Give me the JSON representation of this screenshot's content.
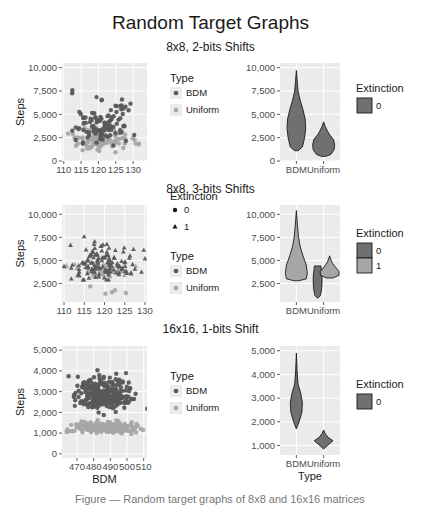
{
  "title": "Random Target Graphs",
  "caption": "Figure — Random target graphs of 8x8 and 16x16 matrices",
  "colors": {
    "panel_bg": "#ebebeb",
    "grid": "#ffffff",
    "bdm": "#595959",
    "uniform": "#a6a6a6",
    "violin_fill": "#707070",
    "violin_fill_light": "#a6a6a6",
    "outline": "#1a1a1a"
  },
  "chart_data": [
    {
      "id": "row1",
      "row_title": "8x8, 2-bits Shifts",
      "scatter": {
        "type": "scatter",
        "xlabel": "",
        "ylabel": "Steps",
        "xlim": [
          109.5,
          134
        ],
        "ylim": [
          0,
          10500
        ],
        "xticks": [
          110,
          115,
          120,
          125,
          130
        ],
        "yticks": [
          0,
          2500,
          5000,
          7500,
          10000
        ],
        "ytick_labels": [
          "0",
          "2,500",
          "5,000",
          "7,500",
          "10,000"
        ],
        "series": [
          {
            "name": "BDM",
            "shape": "circle",
            "n": 110,
            "x_mean": 121,
            "x_sd": 4.5,
            "y_mean": 3600,
            "y_sd": 1400,
            "y_min": 1500,
            "y_max": 9800
          },
          {
            "name": "Uniform",
            "shape": "circle",
            "n": 110,
            "x_mean": 121,
            "x_sd": 4.5,
            "y_mean": 2000,
            "y_sd": 700,
            "y_min": 400,
            "y_max": 4200
          }
        ],
        "legend": {
          "title": "Type",
          "items": [
            "BDM",
            "Uniform"
          ]
        }
      },
      "violin": {
        "type": "violin",
        "xlabel": "",
        "categories": [
          "BDM",
          "Uniform"
        ],
        "ylim": [
          0,
          10500
        ],
        "yticks": [
          0,
          2500,
          5000,
          7500,
          10000
        ],
        "ytick_labels": [
          "0",
          "2,500",
          "5,000",
          "7,500",
          "10,000"
        ],
        "violins": [
          {
            "cat": "BDM",
            "fill": "violin_fill",
            "offset": 0,
            "profile": [
              [
                1100,
                0.15
              ],
              [
                1500,
                0.55
              ],
              [
                2500,
                0.75
              ],
              [
                3500,
                0.85
              ],
              [
                4500,
                0.8
              ],
              [
                5500,
                0.6
              ],
              [
                6500,
                0.35
              ],
              [
                7500,
                0.15
              ],
              [
                8500,
                0.08
              ],
              [
                9700,
                0.0
              ]
            ]
          },
          {
            "cat": "Uniform",
            "fill": "violin_fill",
            "offset": 0,
            "profile": [
              [
                500,
                0.2
              ],
              [
                700,
                0.65
              ],
              [
                1200,
                0.95
              ],
              [
                1700,
                1.0
              ],
              [
                2300,
                0.9
              ],
              [
                2800,
                0.55
              ],
              [
                3200,
                0.35
              ],
              [
                3700,
                0.15
              ],
              [
                4200,
                0.0
              ]
            ]
          }
        ],
        "legend": {
          "title": "Extinction",
          "items": [
            "0"
          ]
        }
      }
    },
    {
      "id": "row2",
      "row_title": "8x8, 3-bits Shifts",
      "scatter": {
        "type": "scatter",
        "xlabel": "",
        "ylabel": "Steps",
        "xlim": [
          109.5,
          130.5
        ],
        "ylim": [
          500,
          11000
        ],
        "xticks": [
          110,
          115,
          120,
          125,
          130
        ],
        "yticks": [
          2500,
          5000,
          7500,
          10000
        ],
        "ytick_labels": [
          "2,500",
          "5,000",
          "7,500",
          "10,000"
        ],
        "series": [
          {
            "name": "BDM",
            "shape": "triangle",
            "n": 130,
            "x_mean": 120,
            "x_sd": 4.5,
            "y_mean": 4300,
            "y_sd": 1300,
            "y_min": 2900,
            "y_max": 10400
          },
          {
            "name": "Uniform",
            "shape": "triangle",
            "n": 50,
            "x_mean": 120,
            "x_sd": 4.5,
            "y_mean": 3700,
            "y_sd": 500,
            "y_min": 3000,
            "y_max": 5500
          },
          {
            "name": "Uniform",
            "shape": "circle",
            "n": 5,
            "x_mean": 121,
            "x_sd": 2.5,
            "y_mean": 1700,
            "y_sd": 500,
            "y_min": 900,
            "y_max": 2900
          }
        ],
        "legend": {
          "title": "Type",
          "items": [
            "BDM",
            "Uniform"
          ],
          "shape_title": "Extinction",
          "shape_items": [
            "0",
            "1"
          ]
        }
      },
      "violin": {
        "type": "violin",
        "xlabel": "",
        "categories": [
          "BDM",
          "Uniform"
        ],
        "ylim": [
          500,
          11000
        ],
        "yticks": [
          2500,
          5000,
          7500,
          10000
        ],
        "ytick_labels": [
          "2,500",
          "5,000",
          "7,500",
          "10,000"
        ],
        "violins": [
          {
            "cat": "BDM",
            "fill": "violin_fill_light",
            "offset": 0,
            "profile": [
              [
                2800,
                0.2
              ],
              [
                3000,
                0.9
              ],
              [
                3600,
                1.0
              ],
              [
                4500,
                0.9
              ],
              [
                5500,
                0.6
              ],
              [
                6500,
                0.35
              ],
              [
                7500,
                0.2
              ],
              [
                8500,
                0.12
              ],
              [
                10400,
                0.0
              ]
            ]
          },
          {
            "cat": "Uniform",
            "fill": "violin_fill",
            "offset": -0.22,
            "profile": [
              [
                900,
                0.0
              ],
              [
                1200,
                0.25
              ],
              [
                1800,
                0.35
              ],
              [
                2500,
                0.4
              ],
              [
                3200,
                0.4
              ],
              [
                3800,
                0.35
              ],
              [
                4400,
                0.3
              ]
            ]
          },
          {
            "cat": "Uniform",
            "fill": "violin_fill_light",
            "offset": 0.22,
            "profile": [
              [
                3100,
                0.3
              ],
              [
                3400,
                0.85
              ],
              [
                3800,
                0.85
              ],
              [
                4300,
                0.5
              ],
              [
                4800,
                0.2
              ],
              [
                5500,
                0.0
              ]
            ]
          }
        ],
        "legend": {
          "title": "Extinction",
          "items": [
            "0",
            "1"
          ]
        }
      }
    },
    {
      "id": "row3",
      "row_title": "16x16, 1-bits Shift",
      "scatter": {
        "type": "scatter",
        "xlabel": "BDM",
        "ylabel": "Steps",
        "xlim": [
          461,
          512
        ],
        "ylim": [
          -200,
          5200
        ],
        "xticks": [
          470,
          480,
          490,
          500,
          510
        ],
        "yticks": [
          0,
          1000,
          2000,
          3000,
          4000,
          5000
        ],
        "ytick_labels": [
          "0",
          "1,000",
          "2,000",
          "3,000",
          "4,000",
          "5,000"
        ],
        "series": [
          {
            "name": "BDM",
            "shape": "circle",
            "n": 260,
            "x_mean": 486,
            "x_sd": 8,
            "y_mean": 2700,
            "y_sd": 500,
            "y_min": 1700,
            "y_max": 4900
          },
          {
            "name": "Uniform",
            "shape": "circle",
            "n": 300,
            "x_mean": 486,
            "x_sd": 9,
            "y_mean": 1200,
            "y_sd": 160,
            "y_min": 800,
            "y_max": 1700
          }
        ],
        "legend": {
          "title": "Type",
          "items": [
            "BDM",
            "Uniform"
          ]
        }
      },
      "violin": {
        "type": "violin",
        "xlabel": "Type",
        "categories": [
          "BDM",
          "Uniform"
        ],
        "ylim": [
          600,
          5200
        ],
        "yticks": [
          1000,
          2000,
          3000,
          4000,
          5000
        ],
        "ytick_labels": [
          "1,000",
          "2,000",
          "3,000",
          "4,000",
          "5,000"
        ],
        "violins": [
          {
            "cat": "BDM",
            "fill": "violin_fill",
            "offset": 0,
            "profile": [
              [
                1700,
                0.0
              ],
              [
                2000,
                0.25
              ],
              [
                2400,
                0.5
              ],
              [
                2800,
                0.55
              ],
              [
                3200,
                0.4
              ],
              [
                3600,
                0.15
              ],
              [
                4200,
                0.06
              ],
              [
                4900,
                0.0
              ]
            ]
          },
          {
            "cat": "Uniform",
            "fill": "violin_fill",
            "offset": 0,
            "profile": [
              [
                850,
                0.0
              ],
              [
                1000,
                0.35
              ],
              [
                1200,
                0.85
              ],
              [
                1350,
                0.4
              ],
              [
                1500,
                0.15
              ],
              [
                1650,
                0.0
              ]
            ]
          }
        ],
        "legend": {
          "title": "Extinction",
          "items": [
            "0"
          ]
        }
      }
    }
  ]
}
